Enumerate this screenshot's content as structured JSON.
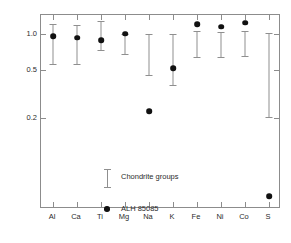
{
  "chart_data": {
    "type": "scatter",
    "title": "",
    "xlabel": "",
    "ylabel": "ELEMENTS/Si RELATIVE TO CI",
    "yscale": "log",
    "ylim": [
      0.035,
      1.45
    ],
    "ytick_values": [
      1.0,
      0.5,
      0.2
    ],
    "ytick_labels": [
      "1.0",
      "0.5",
      "0.2"
    ],
    "grid": false,
    "legend_position": "inside-lower-left",
    "categories": [
      "Al",
      "Ca",
      "Ti",
      "Mg",
      "Na",
      "K",
      "Fe",
      "Ni",
      "Co",
      "S"
    ],
    "series": [
      {
        "name": "ALH 85085",
        "marker": "filled-circle",
        "color": "#111111",
        "values": [
          0.97,
          0.94,
          0.89,
          1.01,
          0.23,
          0.52,
          1.22,
          1.16,
          1.25,
          0.045
        ]
      },
      {
        "name": "Chondrite groups",
        "marker": "error-bar",
        "color": "#8f8f8f",
        "ranges": [
          {
            "category": "Al",
            "low": 0.57,
            "high": 1.21
          },
          {
            "category": "Ca",
            "low": 0.57,
            "high": 1.2
          },
          {
            "category": "Ti",
            "low": 0.74,
            "high": 1.28
          },
          {
            "category": "Mg",
            "low": 0.69,
            "high": 1.01
          },
          {
            "category": "Na",
            "low": 0.46,
            "high": 1.0
          },
          {
            "category": "K",
            "low": 0.38,
            "high": 1.0
          },
          {
            "category": "Fe",
            "low": 0.65,
            "high": 1.07
          },
          {
            "category": "Ni",
            "low": 0.65,
            "high": 1.04
          },
          {
            "category": "Co",
            "low": 0.66,
            "high": 1.06
          },
          {
            "category": "S",
            "low": 0.205,
            "high": 1.02
          }
        ]
      }
    ],
    "legend_entries": [
      {
        "label": "Chondrite groups",
        "marker": "error-bar"
      },
      {
        "label": "ALH 85085",
        "marker": "filled-circle"
      }
    ]
  }
}
